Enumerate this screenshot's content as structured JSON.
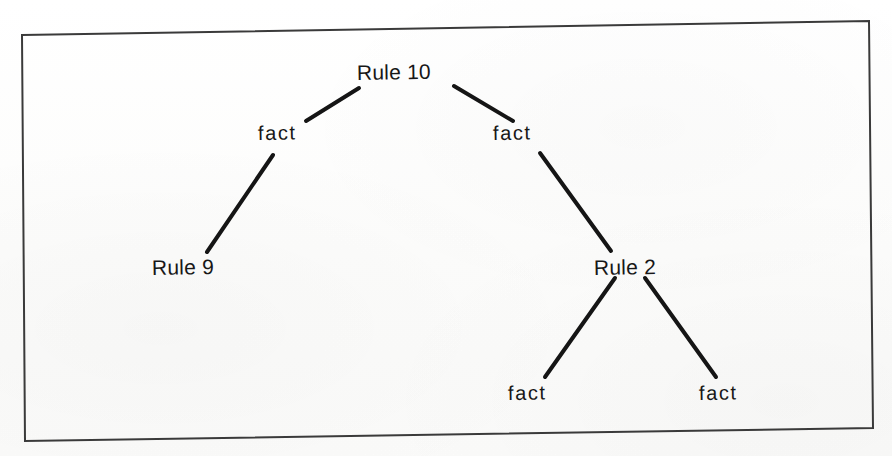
{
  "figure": {
    "kind": "derivation-tree",
    "frame": {
      "stroke_color": "#3a3a3a",
      "stroke_width": 2,
      "corners": {
        "top_left": [
          22,
          35
        ],
        "top_right": [
          869,
          21
        ],
        "bottom_right": [
          873,
          428
        ],
        "bottom_left": [
          25,
          441
        ]
      }
    },
    "background_color": "#fdfdfd",
    "ink_color": "#171717"
  },
  "chart_data": {
    "type": "tree",
    "title": "",
    "nodes": [
      {
        "id": "n0",
        "label": "Rule 10",
        "kind": "rule",
        "depth": 0,
        "x": 400,
        "y": 72
      },
      {
        "id": "n1",
        "label": "fact",
        "kind": "fact",
        "depth": 1,
        "x": 287,
        "y": 132
      },
      {
        "id": "n2",
        "label": "fact",
        "kind": "fact",
        "depth": 1,
        "x": 521,
        "y": 132
      },
      {
        "id": "n3",
        "label": "Rule 9",
        "kind": "rule",
        "depth": 2,
        "x": 191,
        "y": 266
      },
      {
        "id": "n4",
        "label": "Rule 2",
        "kind": "rule",
        "depth": 2,
        "x": 631,
        "y": 266
      },
      {
        "id": "n5",
        "label": "fact",
        "kind": "fact",
        "depth": 3,
        "x": 536,
        "y": 392
      },
      {
        "id": "n6",
        "label": "fact",
        "kind": "fact",
        "depth": 3,
        "x": 727,
        "y": 392
      }
    ],
    "edges": [
      {
        "from": "n0",
        "to": "n1",
        "x1": 359,
        "y1": 88,
        "x2": 306,
        "y2": 121
      },
      {
        "from": "n0",
        "to": "n2",
        "x1": 454,
        "y1": 86,
        "x2": 513,
        "y2": 121
      },
      {
        "from": "n1",
        "to": "n3",
        "x1": 273,
        "y1": 155,
        "x2": 207,
        "y2": 252
      },
      {
        "from": "n2",
        "to": "n4",
        "x1": 540,
        "y1": 153,
        "x2": 611,
        "y2": 251
      },
      {
        "from": "n4",
        "to": "n5",
        "x1": 615,
        "y1": 278,
        "x2": 545,
        "y2": 377
      },
      {
        "from": "n4",
        "to": "n6",
        "x1": 645,
        "y1": 278,
        "x2": 716,
        "y2": 377
      }
    ],
    "edge_style": {
      "color": "#151515",
      "width": 4,
      "linecap": "round"
    }
  },
  "labels": {
    "root": "Rule 10",
    "left_fact": "fact",
    "right_fact": "fact",
    "left_rule": "Rule 9",
    "right_rule": "Rule 2",
    "leaf_fact_left": "fact",
    "leaf_fact_right": "fact"
  }
}
